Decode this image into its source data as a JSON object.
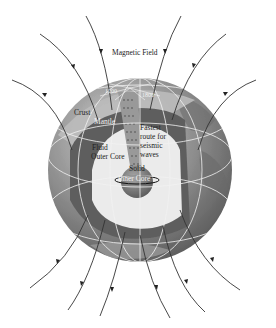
{
  "diagram": {
    "title": "Magnetic Field",
    "labels": {
      "magnetic_field": "Magnetic Field",
      "crust": "Crust",
      "mantle": "Mantle",
      "fluid_outer_core_1": "Fluid",
      "fluid_outer_core_2": "Outer Core",
      "fastest_1": "Fastest",
      "fastest_2": "route for",
      "fastest_3": "seismic",
      "fastest_4": "waves",
      "solid_inner_core_1": "Solid",
      "solid_inner_core_2": "Inner Core",
      "depth_left": "1200",
      "depth_right": "1800"
    },
    "colors": {
      "background": "#ffffff",
      "globe_ocean": "#8a8a8a",
      "crust": "#b8b8b8",
      "mantle": "#5e5e5e",
      "outer_core": "#ececec",
      "inner_core": "#7a7a7a",
      "grid": "#f0f0f0",
      "field_line": "#333333"
    },
    "field_lines": {
      "top_count": 6,
      "bottom_count": 7,
      "direction": "into north pole, out of south"
    }
  }
}
